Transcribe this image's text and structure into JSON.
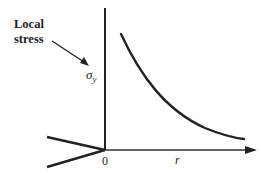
{
  "diagram": {
    "annotation": {
      "line1": "Local",
      "line2": "stress"
    },
    "y_axis_label": "σ",
    "y_axis_subscript": "y",
    "origin_label": "0",
    "x_axis_label": "r",
    "colors": {
      "ink": "#222222",
      "background": "#ffffff"
    }
  }
}
